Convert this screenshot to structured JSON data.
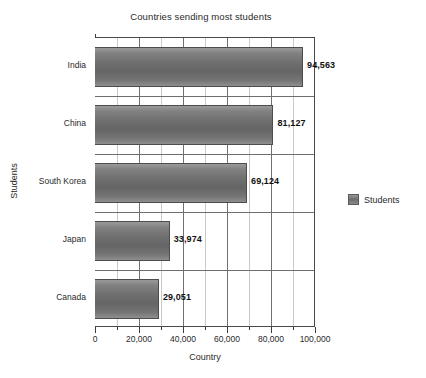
{
  "chart_data": {
    "type": "bar",
    "orientation": "horizontal",
    "title": "Countries sending most students",
    "xlabel": "Country",
    "ylabel": "Students",
    "categories": [
      "India",
      "China",
      "South Korea",
      "Japan",
      "Canada"
    ],
    "values": [
      94563,
      81127,
      69124,
      33974,
      29051
    ],
    "value_labels": [
      "94,563",
      "81,127",
      "69,124",
      "33,974",
      "29,051"
    ],
    "series": [
      {
        "name": "Students",
        "values": [
          94563,
          81127,
          69124,
          33974,
          29051
        ]
      }
    ],
    "xlim": [
      0,
      100000
    ],
    "xticks": [
      0,
      20000,
      40000,
      60000,
      80000,
      100000
    ],
    "xtick_labels": [
      "0",
      "20,000",
      "40,000",
      "60,000",
      "80,000",
      "100,000"
    ],
    "xtick_minor_step": 10000,
    "grid": "vertical-major-minor-and-category-separators",
    "legend": {
      "position": "right",
      "entries": [
        {
          "label": "Students",
          "color": "#6d6d6d"
        }
      ]
    },
    "colors": {
      "bar_fill": "#6d6d6d",
      "bar_edge": "#4c4c4c",
      "axis": "#3a3a3a",
      "grid_major": "#707070",
      "grid_minor": "#c9c9c9",
      "text": "#2a2a2a",
      "background": "#ffffff"
    }
  }
}
